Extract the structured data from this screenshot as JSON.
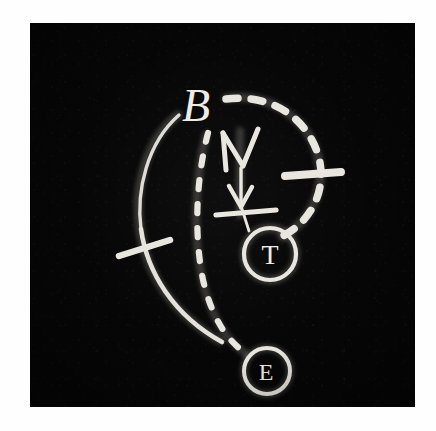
{
  "image": {
    "medium": "hand-drawn chalk diagram on black board",
    "border_color": "#fefefe",
    "board_color": "#060606",
    "chalk_color": "#e9e6df",
    "photo": {
      "left": 30,
      "top": 23,
      "width": 385,
      "height": 384
    }
  },
  "diagram": {
    "title": "",
    "nodes": [
      {
        "id": "B",
        "label": "B",
        "shape": "plain-letter",
        "x": 176,
        "y": 84,
        "font_size": 46
      },
      {
        "id": "T",
        "label": "T",
        "shape": "circled-letter",
        "x": 240,
        "y": 231,
        "radius": 26,
        "font_size": 28
      },
      {
        "id": "E",
        "label": "E",
        "shape": "circled-letter",
        "x": 237,
        "y": 348,
        "radius": 23,
        "font_size": 24
      }
    ],
    "edges": [
      {
        "id": "solid-left-arc",
        "style": "solid",
        "from": "B",
        "to": "E",
        "description": "solid arc sweeping left then down-right"
      },
      {
        "id": "dashed-top-right-arc",
        "style": "dashed",
        "from": "B",
        "to": "T",
        "description": "dashed arc over the top curving down to T"
      },
      {
        "id": "dashed-middle-curve",
        "style": "dashed",
        "from": "B",
        "to": "E",
        "description": "dashed curve down the middle to E"
      },
      {
        "id": "center-arrow",
        "style": "solid-arrow",
        "from": "B",
        "to": "T",
        "description": "vertical downward arrow with two chevrons and a crossbar"
      }
    ],
    "tick_marks": [
      {
        "id": "tick-left-arc",
        "on": "solid-left-arc",
        "orientation": "diagonal"
      },
      {
        "id": "tick-right-arc",
        "on": "dashed-top-right-arc",
        "orientation": "horizontal"
      },
      {
        "id": "tick-center-arrow",
        "on": "center-arrow",
        "orientation": "horizontal"
      }
    ]
  }
}
